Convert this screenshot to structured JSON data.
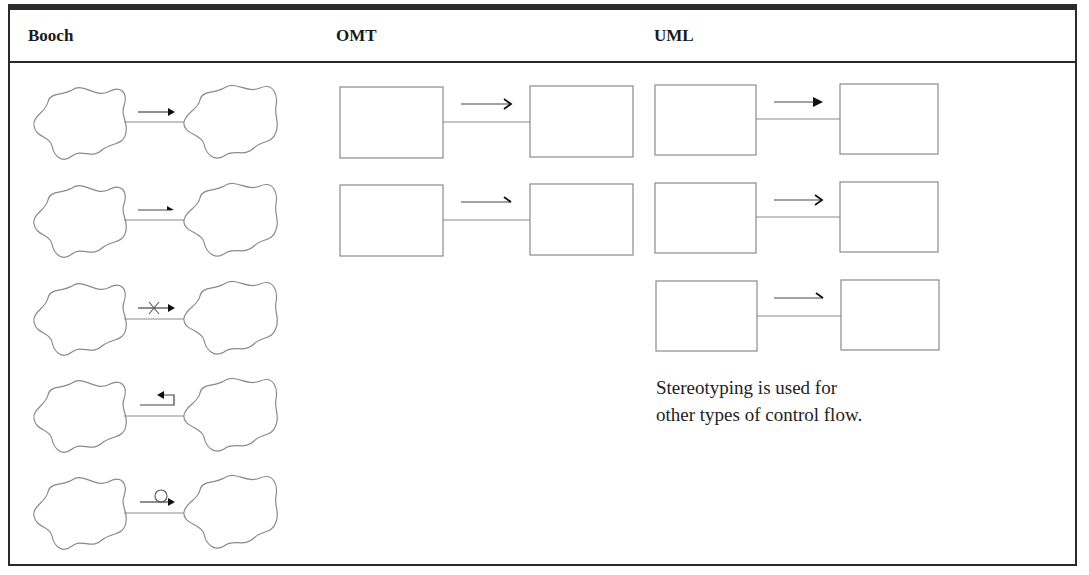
{
  "table": {
    "columns": [
      {
        "label": "Booch"
      },
      {
        "label": "OMT"
      },
      {
        "label": "UML"
      }
    ]
  },
  "booch": {
    "notation": "cloud-to-cloud association with control-flow adornment",
    "rows": [
      {
        "adornment": "filled-arrow",
        "meaning": "simple/synchronous message"
      },
      {
        "adornment": "half-arrow",
        "meaning": "asynchronous message"
      },
      {
        "adornment": "cross-arrow",
        "meaning": "balking message"
      },
      {
        "adornment": "return-arrow",
        "meaning": "timeout message"
      },
      {
        "adornment": "circle-arrow",
        "meaning": "periodic message"
      }
    ]
  },
  "omt": {
    "notation": "class-box to class-box association",
    "rows": [
      {
        "adornment": "open-arrow"
      },
      {
        "adornment": "half-arrow"
      }
    ]
  },
  "uml": {
    "notation": "class-box to class-box association",
    "rows": [
      {
        "adornment": "filled-arrow"
      },
      {
        "adornment": "open-arrow"
      },
      {
        "adornment": "half-arrow"
      }
    ],
    "note_line1": "Stereotyping is used for",
    "note_line2": "other types of control flow."
  },
  "colors": {
    "border": "#2a2a2a",
    "shape_stroke": "#8a8a8a",
    "arrow": "#1a1a1a"
  }
}
